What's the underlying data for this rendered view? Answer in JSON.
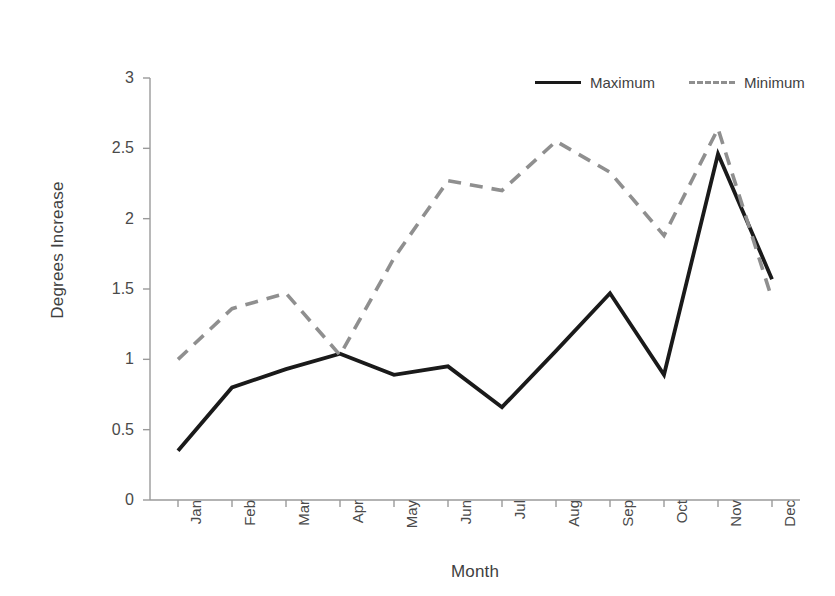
{
  "chart_data": {
    "type": "line",
    "title": "",
    "xlabel": "Month",
    "ylabel": "Degrees Increase",
    "categories": [
      "Jan",
      "Feb",
      "Mar",
      "Apr",
      "May",
      "Jun",
      "Jul",
      "Aug",
      "Sep",
      "Oct",
      "Nov",
      "Dec"
    ],
    "series": [
      {
        "name": "Maximum",
        "style": "solid",
        "color": "#1a1a1a",
        "values": [
          0.35,
          0.8,
          0.93,
          1.04,
          0.89,
          0.95,
          0.66,
          1.06,
          1.47,
          0.89,
          2.46,
          1.57
        ]
      },
      {
        "name": "Minimum",
        "style": "dashed",
        "color": "#8f8f8f",
        "values": [
          1.0,
          1.36,
          1.47,
          1.03,
          1.72,
          2.27,
          2.2,
          2.55,
          2.33,
          1.88,
          2.64,
          1.43
        ]
      }
    ],
    "ylim": [
      0,
      3
    ],
    "ytick_labels": [
      "3",
      "2.5",
      "2",
      "1.5",
      "1",
      "0.5",
      "0"
    ],
    "ytick_values": [
      3,
      2.5,
      2,
      1.5,
      1,
      0.5,
      0
    ],
    "grid": false,
    "legend_position": "top-right",
    "axis_color": "#9a9a9a"
  },
  "legend": {
    "entries": [
      {
        "label": "Maximum",
        "style": "solid"
      },
      {
        "label": "Minimum",
        "style": "dashed"
      }
    ]
  }
}
